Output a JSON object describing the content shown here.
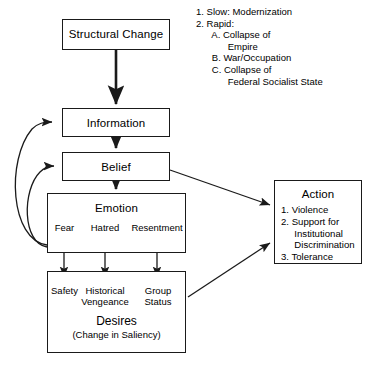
{
  "diagram": {
    "structural_change": {
      "label": "Structural  Change"
    },
    "causes_list": {
      "lines": [
        "1. Slow: Modernization",
        "2. Rapid:",
        "      A. Collapse of",
        "            Empire",
        "      B. War/Occupation",
        "      C. Collapse of",
        "            Federal Socialist State"
      ]
    },
    "information": {
      "label": "Information"
    },
    "belief": {
      "label": "Belief"
    },
    "emotion": {
      "label": "Emotion",
      "items": [
        "Fear",
        "Hatred",
        "Resentment"
      ]
    },
    "desires": {
      "items": [
        "Safety",
        "Historical\nVengeance",
        "Group\nStatus"
      ],
      "title": "Desires",
      "subtitle": "(Change in Saliency)"
    },
    "action": {
      "label": "Action",
      "lines": [
        "1. Violence",
        "2. Support for",
        "     Institutional",
        "     Discrimination",
        "3. Tolerance"
      ]
    },
    "caption": ""
  },
  "colors": {
    "stroke": "#1a1a1a",
    "background": "#ffffff",
    "text": "#000000"
  }
}
